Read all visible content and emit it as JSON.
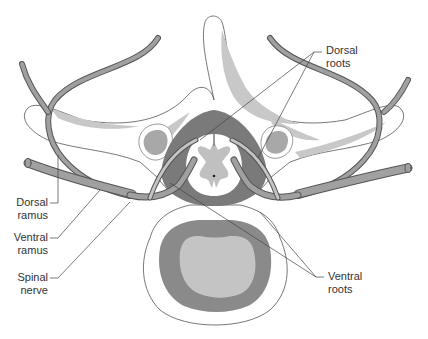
{
  "diagram": {
    "colors": {
      "background": "#ffffff",
      "bone_outline": "#555555",
      "light_grey": "#c8c8c8",
      "mid_grey": "#a8a8a8",
      "dark_grey": "#7a7a7a",
      "nerve_fill": "#a0a0a0",
      "nerve_outline": "#555555",
      "leader_line": "#444444",
      "label_text": "#333333"
    },
    "labels": {
      "dorsal_roots": "Dorsal\nroots",
      "dorsal_ramus": "Dorsal\nramus",
      "ventral_ramus": "Ventral\nramus",
      "spinal_nerve": "Spinal\nnerve",
      "ventral_roots": "Ventral\nroots"
    }
  }
}
